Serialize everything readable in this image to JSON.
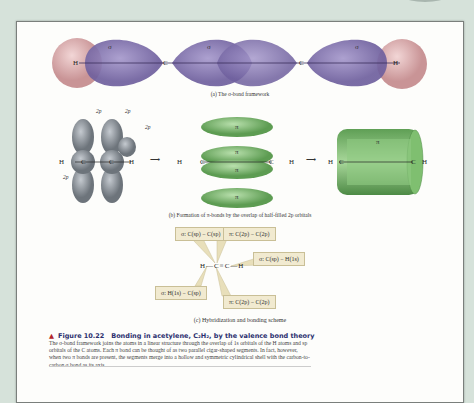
{
  "figure": {
    "number_label": "Figure 10.22",
    "title": "Bonding in acetylene, C₂H₂, by the valence bond theory",
    "body": "The σ-bond framework joins the atoms in a linear structure through the overlap of 1s orbitals of the H atoms and sp orbitals of the C atoms. Each π bond can be thought of as two parallel cigar-shaped segments. In fact, however, when two π bonds are present, the segments merge into a hollow and symmetric cylindrical shell with the carbon-to-carbon σ bond as its axis."
  },
  "part_a": {
    "caption": "(a) The σ-bond framework",
    "atoms": [
      "H",
      "C",
      "C",
      "H"
    ],
    "sigma_labels": [
      "σ",
      "σ",
      "σ"
    ]
  },
  "part_b": {
    "caption": "(b) Formation of π-bonds by the overlap of half-filled 2p orbitals",
    "orbital_labels": [
      "2p",
      "2p",
      "2p",
      "2p"
    ],
    "atoms_1": [
      "H",
      "C",
      "C",
      "H"
    ],
    "atoms_2": [
      "H",
      "C",
      "C",
      "H"
    ],
    "atoms_3": [
      "H",
      "C",
      "C",
      "H"
    ],
    "pi_labels": [
      "π",
      "π",
      "π",
      "π"
    ],
    "cylinder_label": "π",
    "arrow": "⟶"
  },
  "part_c": {
    "caption": "(c) Hybridization and bonding scheme",
    "molecule": {
      "h1": "H",
      "c1": "C",
      "c2": "C",
      "h2": "H"
    },
    "labels": [
      "σ: C(sp) − C(sp)",
      "π: C(2p) − C(2p)",
      "σ: C(sp) − H(1s)",
      "σ: H(1s) − C(sp)",
      "π: C(2p) − C(2p)"
    ]
  },
  "colors": {
    "sigma_lobe": "#8a7bb5",
    "hydrogen": "#d9aeb0",
    "pi_lobe": "#7dbb6e",
    "p_orbital": "#8e959c",
    "label_box": "#f1ead0",
    "title_color": "#2b2f6e",
    "triangle": "#b3262b"
  }
}
